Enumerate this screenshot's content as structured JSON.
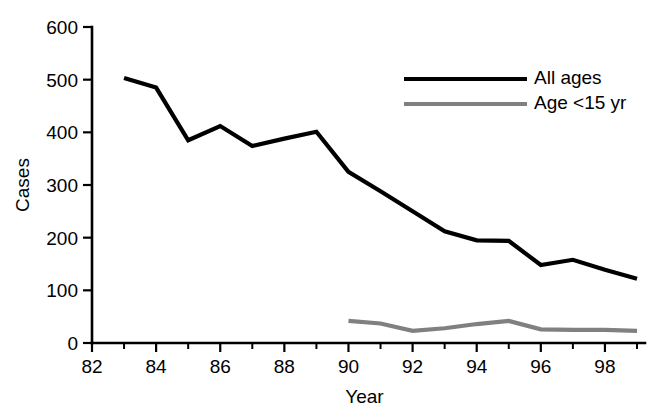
{
  "chart_data": {
    "type": "line",
    "title": "",
    "xlabel": "Year",
    "ylabel": "Cases",
    "xlim": [
      82,
      99
    ],
    "ylim": [
      0,
      600
    ],
    "grid": false,
    "legend_position": "top-right",
    "x_tick_labels": [
      "82",
      "84",
      "86",
      "88",
      "90",
      "92",
      "94",
      "96",
      "98"
    ],
    "x_tick_values": [
      82,
      84,
      86,
      88,
      90,
      92,
      94,
      96,
      98
    ],
    "x_minor_tick_values": [
      83,
      85,
      87,
      89,
      91,
      93,
      95,
      97,
      99
    ],
    "y_tick_labels": [
      "0",
      "100",
      "200",
      "300",
      "400",
      "500",
      "600"
    ],
    "y_tick_values": [
      0,
      100,
      200,
      300,
      400,
      500,
      600
    ],
    "series": [
      {
        "name": "All ages",
        "color": "#000000",
        "line_width": 4.2,
        "x": [
          83,
          84,
          85,
          86,
          87,
          88,
          89,
          90,
          91,
          92,
          93,
          94,
          95,
          96,
          97,
          98,
          99
        ],
        "values": [
          503,
          485,
          385,
          412,
          374,
          388,
          401,
          325,
          288,
          250,
          212,
          195,
          194,
          148,
          158,
          139,
          122
        ]
      },
      {
        "name": "Age <15 yr",
        "color": "#808080",
        "line_width": 4.2,
        "x": [
          90,
          91,
          92,
          93,
          94,
          95,
          96,
          97,
          98,
          99
        ],
        "values": [
          42,
          37,
          23,
          28,
          36,
          42,
          26,
          25,
          25,
          23
        ]
      }
    ]
  },
  "legend": {
    "entries": [
      {
        "label": "All ages",
        "color": "#000000"
      },
      {
        "label": "Age <15 yr",
        "color": "#808080"
      }
    ]
  }
}
